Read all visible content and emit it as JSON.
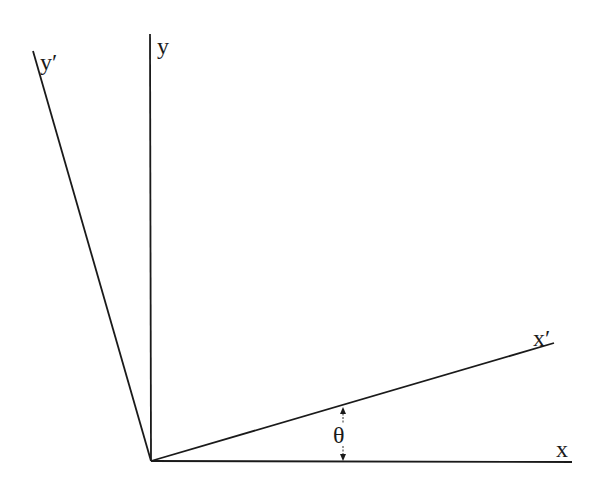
{
  "diagram": {
    "labels": {
      "y": "y",
      "y_prime": "y′",
      "x": "x",
      "x_prime": "x′",
      "theta": "θ"
    },
    "colors": {
      "line": "#1a1a1a",
      "background": "#ffffff"
    }
  }
}
